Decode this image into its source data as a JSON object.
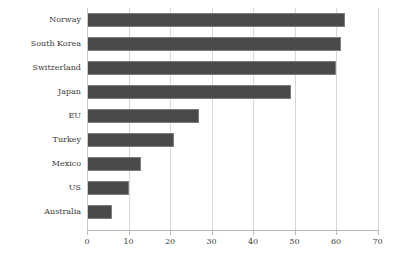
{
  "chart_data": {
    "type": "bar",
    "orientation": "horizontal",
    "title": "",
    "subtitle": "",
    "xlabel": "",
    "ylabel": "",
    "xlim": [
      0,
      70
    ],
    "xticks": [
      0,
      10,
      20,
      30,
      40,
      50,
      60,
      70
    ],
    "xtick_labels": [
      "0",
      "10",
      "20",
      "30",
      "40",
      "50",
      "60",
      "70"
    ],
    "grid": "vertical",
    "legend": "none",
    "categories": [
      "Norway",
      "South Korea",
      "Switzerland",
      "Japan",
      "EU",
      "Turkey",
      "Mexico",
      "US",
      "Australia"
    ],
    "values": [
      62,
      61,
      60,
      49,
      27,
      21,
      13,
      10,
      6
    ],
    "series": [
      {
        "name": "",
        "values": [
          62,
          61,
          60,
          49,
          27,
          21,
          13,
          10,
          6
        ]
      }
    ],
    "colors": {
      "bar_fill": "#4a4a4a",
      "bar_edge": "#7d7d7d",
      "gridline": "#d8d8d8",
      "axis": "#b9b9b9",
      "text": "#3b3b3b",
      "background": "#ffffff"
    }
  }
}
